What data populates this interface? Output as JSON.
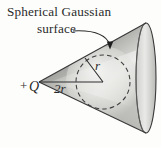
{
  "figure": {
    "caption_line1": "Spherical Gaussian",
    "caption_line2": "surface",
    "charge_sign": "+",
    "charge_symbol": "Q",
    "diameter_label": "2r",
    "radius_label": "r",
    "colors": {
      "background": "#fdfdfc",
      "cone_outline": "#3a3a3a",
      "cone_shade_dark": "#8a8a8a",
      "cone_shade_mid": "#b4b4b4",
      "cone_shade_light": "#e8e8e6",
      "sphere_dashed": "#3d3d3d",
      "text": "#2b2b2b",
      "leader_line": "#2b2b2b"
    },
    "geometry": {
      "apex": [
        39,
        82
      ],
      "sphere_center": [
        103,
        82
      ],
      "sphere_radius": 27,
      "radius_line_end": [
        85,
        58
      ],
      "cone_base_center": [
        142,
        78
      ],
      "cone_base_rx": 10,
      "cone_base_ry": 55,
      "arrow_tip": [
        110,
        48
      ]
    },
    "elements": {
      "cone_name": "cone-solid",
      "sphere_name": "gaussian-sphere-dashed",
      "leader_name": "caption-leader-arrow",
      "diameter_name": "diameter-line",
      "radius_name": "radius-line",
      "charge_name": "point-charge-marker"
    }
  }
}
